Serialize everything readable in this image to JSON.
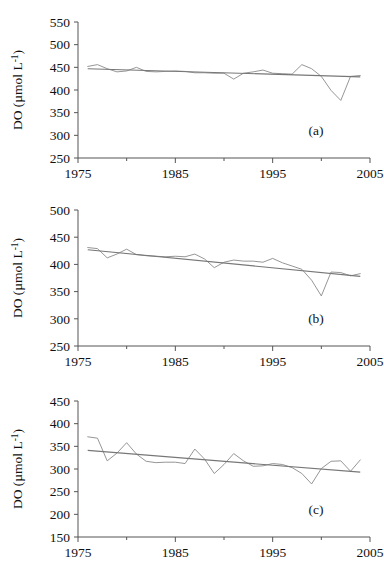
{
  "figure": {
    "type": "multi-panel-line-chart",
    "panel_count": 3,
    "shared_xlabel": "",
    "x_tick_labels": [
      "1975",
      "1985",
      "1995",
      "2005"
    ],
    "ylabel_main": "DO (",
    "ylabel_mu": "µmol L",
    "ylabel_sup": "-1",
    "ylabel_close": ")"
  },
  "chart_data": [
    {
      "type": "line",
      "panel": "a",
      "tag": "(a)",
      "title": "",
      "xlabel": "",
      "ylabel": "DO (µmol L⁻¹)",
      "xlim": [
        1975,
        2005
      ],
      "ylim": [
        250,
        550
      ],
      "yticks": [
        250,
        300,
        350,
        400,
        450,
        500,
        550
      ],
      "xticks": [
        1975,
        1985,
        1995,
        2005
      ],
      "xminorticks": [
        1980,
        1990,
        2000
      ],
      "grid": false,
      "legend": "none",
      "series": [
        {
          "name": "DO annual mean",
          "x": [
            1976,
            1977,
            1978,
            1979,
            1980,
            1981,
            1982,
            1983,
            1984,
            1985,
            1986,
            1987,
            1988,
            1989,
            1990,
            1991,
            1992,
            1993,
            1994,
            1995,
            1996,
            1997,
            1998,
            1999,
            2000,
            2001,
            2002,
            2003,
            2004
          ],
          "values": [
            452,
            456,
            447,
            440,
            442,
            450,
            441,
            440,
            441,
            442,
            441,
            438,
            438,
            437,
            437,
            424,
            437,
            440,
            444,
            437,
            436,
            435,
            456,
            447,
            430,
            399,
            377,
            430,
            432
          ]
        },
        {
          "name": "Linear trend",
          "x": [
            1976,
            2004
          ],
          "values": [
            447,
            429
          ]
        }
      ]
    },
    {
      "type": "line",
      "panel": "b",
      "tag": "(b)",
      "title": "",
      "xlabel": "",
      "ylabel": "DO (µmol L⁻¹)",
      "xlim": [
        1975,
        2005
      ],
      "ylim": [
        250,
        500
      ],
      "yticks": [
        250,
        300,
        350,
        400,
        450,
        500
      ],
      "xticks": [
        1975,
        1985,
        1995,
        2005
      ],
      "xminorticks": [
        1980,
        1990,
        2000
      ],
      "grid": false,
      "legend": "none",
      "series": [
        {
          "name": "DO annual mean",
          "x": [
            1976,
            1977,
            1978,
            1979,
            1980,
            1981,
            1982,
            1983,
            1984,
            1985,
            1986,
            1987,
            1988,
            1989,
            1990,
            1991,
            1992,
            1993,
            1994,
            1995,
            1996,
            1997,
            1998,
            1999,
            2000,
            2001,
            2002,
            2003,
            2004
          ],
          "values": [
            431,
            429,
            412,
            419,
            428,
            418,
            416,
            415,
            414,
            415,
            414,
            419,
            410,
            394,
            404,
            408,
            406,
            406,
            404,
            411,
            403,
            397,
            391,
            371,
            342,
            386,
            385,
            379,
            383
          ]
        },
        {
          "name": "Linear trend",
          "x": [
            1976,
            2004
          ],
          "values": [
            427,
            378
          ]
        }
      ]
    },
    {
      "type": "line",
      "panel": "c",
      "tag": "(c)",
      "title": "",
      "xlabel": "",
      "ylabel": "DO (µmol L⁻¹)",
      "xlim": [
        1975,
        2005
      ],
      "ylim": [
        150,
        450
      ],
      "yticks": [
        150,
        200,
        250,
        300,
        350,
        400,
        450
      ],
      "xticks": [
        1975,
        1985,
        1995,
        2005
      ],
      "xminorticks": [
        1980,
        1990,
        2000
      ],
      "grid": false,
      "legend": "none",
      "series": [
        {
          "name": "DO annual mean",
          "x": [
            1976,
            1977,
            1978,
            1979,
            1980,
            1981,
            1982,
            1983,
            1984,
            1985,
            1986,
            1987,
            1988,
            1989,
            1990,
            1991,
            1992,
            1993,
            1994,
            1995,
            1996,
            1997,
            1998,
            1999,
            2000,
            2001,
            2002,
            2003,
            2004
          ],
          "values": [
            371,
            368,
            318,
            335,
            358,
            333,
            317,
            314,
            315,
            315,
            312,
            344,
            322,
            290,
            310,
            334,
            318,
            306,
            307,
            312,
            310,
            303,
            290,
            267,
            301,
            317,
            318,
            295,
            320
          ]
        },
        {
          "name": "Linear trend",
          "x": [
            1976,
            2004
          ],
          "values": [
            341,
            293
          ]
        }
      ]
    }
  ]
}
